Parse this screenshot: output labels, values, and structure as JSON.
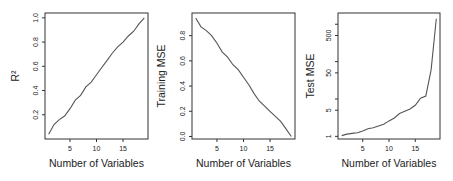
{
  "chart_data": [
    {
      "type": "line",
      "title": "",
      "xlabel": "Number of Variables",
      "ylabel": "R²",
      "x": [
        1,
        2,
        3,
        4,
        5,
        6,
        7,
        8,
        9,
        10,
        11,
        12,
        13,
        14,
        15,
        16,
        17,
        18,
        19
      ],
      "values": [
        0.04,
        0.12,
        0.16,
        0.19,
        0.25,
        0.32,
        0.36,
        0.43,
        0.47,
        0.53,
        0.59,
        0.65,
        0.71,
        0.76,
        0.8,
        0.85,
        0.89,
        0.95,
        1.0
      ],
      "xticks": [
        5,
        10,
        15
      ],
      "yticks": [
        0.2,
        0.4,
        0.6,
        0.8,
        1.0
      ],
      "ytick_labels": [
        "0.2",
        "0.4",
        "0.6",
        "0.8",
        "1.0"
      ],
      "xlim": [
        0.3,
        19.7
      ],
      "ylim": [
        0.0,
        1.04
      ],
      "yscale": "linear",
      "grid": false
    },
    {
      "type": "line",
      "title": "",
      "xlabel": "Number of Variables",
      "ylabel": "Training MSE",
      "x": [
        1,
        2,
        3,
        4,
        5,
        6,
        7,
        8,
        9,
        10,
        11,
        12,
        13,
        14,
        15,
        16,
        17,
        18,
        19
      ],
      "values": [
        0.94,
        0.87,
        0.84,
        0.8,
        0.74,
        0.67,
        0.63,
        0.57,
        0.53,
        0.47,
        0.41,
        0.34,
        0.28,
        0.24,
        0.2,
        0.16,
        0.12,
        0.06,
        0.0
      ],
      "xticks": [
        5,
        10,
        15
      ],
      "yticks": [
        0.0,
        0.2,
        0.4,
        0.6,
        0.8
      ],
      "ytick_labels": [
        "0.0",
        "0.2",
        "0.4",
        "0.6",
        "0.8"
      ],
      "xlim": [
        0.3,
        19.7
      ],
      "ylim": [
        -0.02,
        0.98
      ],
      "yscale": "linear",
      "grid": false
    },
    {
      "type": "line",
      "title": "",
      "xlabel": "Number of Variables",
      "ylabel": "Test MSE",
      "x": [
        1,
        2,
        3,
        4,
        5,
        6,
        7,
        8,
        9,
        10,
        11,
        12,
        13,
        14,
        15,
        16,
        17,
        18,
        19
      ],
      "values": [
        1.05,
        1.15,
        1.2,
        1.25,
        1.4,
        1.6,
        1.7,
        1.9,
        2.1,
        2.6,
        3.1,
        4.1,
        4.7,
        5.4,
        6.8,
        10.5,
        12,
        60,
        1400
      ],
      "xticks": [
        5,
        10,
        15
      ],
      "yticks": [
        1,
        5,
        10,
        50,
        100,
        500,
        1000
      ],
      "ytick_labels": [
        "1",
        "5",
        "",
        "50",
        "",
        "500",
        ""
      ],
      "xlim": [
        0.3,
        19.7
      ],
      "ylim": [
        0.85,
        2000
      ],
      "yscale": "log",
      "grid": false
    }
  ]
}
